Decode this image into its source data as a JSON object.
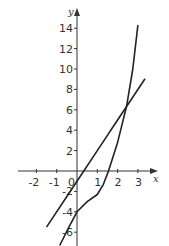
{
  "chart_data": {
    "type": "line",
    "title": "",
    "xlabel": "x",
    "ylabel": "y",
    "xlim": [
      -2.7,
      3.6
    ],
    "ylim": [
      -7.4,
      16
    ],
    "grid": false,
    "legend": null,
    "x_ticks": [
      "-2",
      "-1",
      "0",
      "1",
      "2",
      "3"
    ],
    "y_ticks": [
      "-6",
      "-4",
      "-2",
      "2",
      "4",
      "6",
      "8",
      "10",
      "12",
      "14"
    ],
    "series": [
      {
        "name": "line",
        "x": [
          -1.5,
          0,
          1,
          2,
          3.35
        ],
        "y": [
          -5.5,
          -1,
          2,
          5,
          9.05
        ]
      },
      {
        "name": "cubic curve",
        "x": [
          -0.85,
          -0.4,
          0,
          0.5,
          1,
          1.3,
          1.55,
          2,
          2.45,
          2.75,
          3.0
        ],
        "y": [
          -7.3,
          -5.5,
          -4,
          -3.0,
          -2.3,
          -1.3,
          0,
          2.8,
          6.4,
          10,
          14.3
        ]
      }
    ]
  }
}
